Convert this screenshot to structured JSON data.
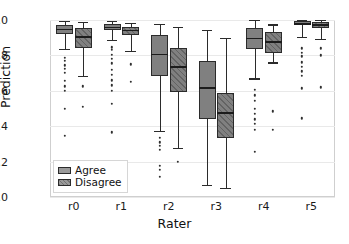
{
  "chart_data": {
    "type": "box",
    "title": "",
    "xlabel": "Rater",
    "ylabel": "Prediction",
    "categories": [
      "r0",
      "r1",
      "r2",
      "r3",
      "r4",
      "r5"
    ],
    "ylim": [
      0.0,
      1.0
    ],
    "xlim": [
      0,
      6
    ],
    "yticks": [
      "0.0",
      "0.2",
      "0.4",
      "0.6",
      "0.8",
      "1.0"
    ],
    "ytick_values": [
      0.0,
      0.2,
      0.4,
      0.6,
      0.8,
      1.0
    ],
    "grid": true,
    "grid_axis": "y",
    "legend": {
      "position": "lower left",
      "entries": [
        {
          "label": "Agree",
          "fill": "#808080",
          "hatch": "none"
        },
        {
          "label": "Disagree",
          "fill": "#808080",
          "hatch": "diagonal"
        }
      ]
    },
    "series": [
      {
        "name": "Agree",
        "boxes": [
          {
            "category": "r0",
            "whisker_low": 0.835,
            "q1": 0.92,
            "median": 0.95,
            "q3": 0.972,
            "whisker_high": 0.995,
            "fliers": [
              0.785,
              0.77,
              0.745,
              0.725,
              0.7,
              0.655,
              0.625,
              0.6,
              0.5,
              0.345
            ]
          },
          {
            "category": "r1",
            "whisker_low": 0.885,
            "q1": 0.942,
            "median": 0.962,
            "q3": 0.978,
            "whisker_high": 0.995,
            "fliers": [
              0.845,
              0.83,
              0.805,
              0.78,
              0.755,
              0.72,
              0.69,
              0.66,
              0.63,
              0.6,
              0.525,
              0.365
            ]
          },
          {
            "category": "r2",
            "whisker_low": 0.375,
            "q1": 0.685,
            "median": 0.81,
            "q3": 0.915,
            "whisker_high": 0.98,
            "fliers": [
              0.335,
              0.31,
              0.29,
              0.265,
              0.175,
              0.155,
              0.115
            ]
          },
          {
            "category": "r3",
            "whisker_low": 0.07,
            "q1": 0.44,
            "median": 0.62,
            "q3": 0.77,
            "whisker_high": 0.945,
            "fliers": []
          },
          {
            "category": "r4",
            "whisker_low": 0.67,
            "q1": 0.835,
            "median": 0.9,
            "q3": 0.955,
            "whisker_high": 0.998,
            "fliers": [
              0.605,
              0.575,
              0.545,
              0.5,
              0.47,
              0.44,
              0.415,
              0.38,
              0.255
            ]
          },
          {
            "category": "r5",
            "whisker_low": 0.905,
            "q1": 0.972,
            "median": 0.982,
            "q3": 0.992,
            "whisker_high": 1.0,
            "fliers": [
              0.84,
              0.815,
              0.795,
              0.76,
              0.735,
              0.71,
              0.685,
              0.615,
              0.445
            ]
          }
        ]
      },
      {
        "name": "Disagree",
        "boxes": [
          {
            "category": "r0",
            "whisker_low": 0.685,
            "q1": 0.84,
            "median": 0.91,
            "q3": 0.955,
            "whisker_high": 0.99,
            "fliers": [
              0.625,
              0.51
            ]
          },
          {
            "category": "r1",
            "whisker_low": 0.825,
            "q1": 0.915,
            "median": 0.945,
            "q3": 0.962,
            "whisker_high": 0.985,
            "fliers": [
              0.75,
              0.65
            ]
          },
          {
            "category": "r2",
            "whisker_low": 0.275,
            "q1": 0.595,
            "median": 0.74,
            "q3": 0.84,
            "whisker_high": 0.96,
            "fliers": [
              0.198
            ]
          },
          {
            "category": "r3",
            "whisker_low": 0.05,
            "q1": 0.335,
            "median": 0.48,
            "q3": 0.585,
            "whisker_high": 0.9,
            "fliers": []
          },
          {
            "category": "r4",
            "whisker_low": 0.76,
            "q1": 0.815,
            "median": 0.88,
            "q3": 0.93,
            "whisker_high": 0.975,
            "fliers": [
              0.485,
              0.38
            ]
          },
          {
            "category": "r5",
            "whisker_low": 0.895,
            "q1": 0.955,
            "median": 0.975,
            "q3": 0.988,
            "whisker_high": 0.998,
            "fliers": [
              0.84,
              0.8,
              0.62
            ]
          }
        ]
      }
    ]
  }
}
